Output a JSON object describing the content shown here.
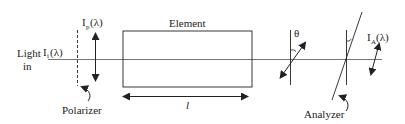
{
  "diagram": {
    "colors": {
      "stroke": "#222222",
      "beam": "#555555",
      "background": "#ffffff"
    },
    "labels": {
      "light_in_line1": "Light",
      "light_in_line2": "in",
      "input_intensity": "I",
      "input_intensity_sub": "i",
      "input_intensity_arg": "(λ)",
      "polarized_intensity": "I",
      "polarized_intensity_sub": "p",
      "polarized_intensity_arg": "(λ)",
      "element": "Element",
      "length": "l",
      "angle": "θ",
      "analyzed_intensity": "I",
      "analyzed_intensity_sub": "A",
      "analyzed_intensity_arg": "(λ)",
      "polarizer": "Polarizer",
      "analyzer": "Analyzer"
    },
    "components": [
      {
        "id": "polarizer",
        "label": "Polarizer"
      },
      {
        "id": "element",
        "label": "Element"
      },
      {
        "id": "rotated-polarization",
        "label": "θ"
      },
      {
        "id": "analyzer",
        "label": "Analyzer"
      }
    ]
  }
}
